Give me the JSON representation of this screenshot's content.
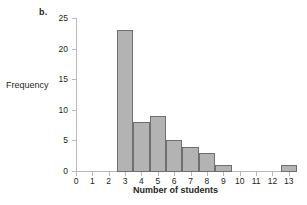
{
  "panel": {
    "letter": "b."
  },
  "axes": {
    "ylabel": "Frequency",
    "xlabel": "Number of students",
    "y_ticks": [
      0,
      5,
      10,
      15,
      20,
      25
    ],
    "x_ticks": [
      0,
      1,
      2,
      3,
      4,
      5,
      6,
      7,
      8,
      9,
      10,
      11,
      12,
      13
    ]
  },
  "colors": {
    "bar_fill": "#b3b3b3",
    "bar_stroke": "#6f6f6f",
    "axis": "#b9b9b9",
    "text": "#231f20",
    "background": "#ffffff"
  },
  "chart_data": {
    "type": "bar",
    "title": "",
    "subtitle": "",
    "xlabel": "Number of students",
    "ylabel": "Frequency",
    "categories": [
      3,
      4,
      5,
      6,
      7,
      8,
      9,
      13
    ],
    "values": [
      23,
      8,
      9,
      5,
      4,
      3,
      1,
      1
    ],
    "bin_width": 1,
    "bin_edges": [
      2.5,
      3.5,
      4.5,
      5.5,
      6.5,
      7.5,
      8.5,
      9.5,
      12.5,
      13.5
    ],
    "xlim": [
      0,
      13.5
    ],
    "ylim": [
      0,
      25
    ],
    "xticks": [
      0,
      1,
      2,
      3,
      4,
      5,
      6,
      7,
      8,
      9,
      10,
      11,
      12,
      13
    ],
    "yticks": [
      0,
      5,
      10,
      15,
      20,
      25
    ],
    "grid": false,
    "legend": false,
    "annotations": [
      "b."
    ]
  }
}
